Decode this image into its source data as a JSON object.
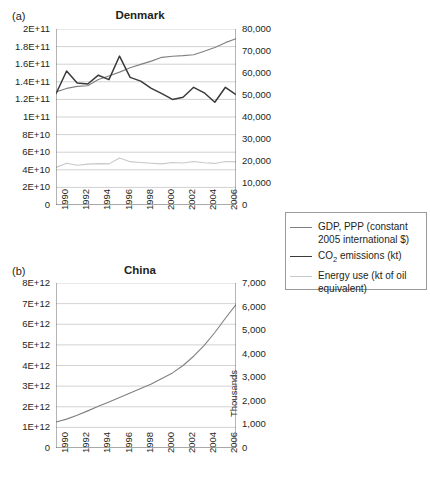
{
  "figure": {
    "panels": [
      {
        "key": "denmark",
        "label": "(a)",
        "title": "Denmark"
      },
      {
        "key": "china",
        "label": "(b)",
        "title": "China"
      }
    ]
  },
  "legend": {
    "items": [
      {
        "name": "gdp",
        "label": "GDP, PPP (constant 2005 international $)",
        "color": "#808080"
      },
      {
        "name": "co2",
        "label": "CO2 emissions (kt)",
        "label_pre": "CO",
        "label_sub": "2",
        "label_post": " emissions (kt)",
        "color": "#3a3a3a"
      },
      {
        "name": "energy",
        "label": "Energy use (kt of oil equivalent)",
        "color": "#c8c8c8"
      }
    ]
  },
  "chart_data": [
    {
      "type": "line",
      "title": "Denmark",
      "panel_label": "(a)",
      "xlabel": "",
      "ylabel": "",
      "x": [
        1990,
        1991,
        1992,
        1993,
        1994,
        1995,
        1996,
        1997,
        1998,
        1999,
        2000,
        2001,
        2002,
        2003,
        2004,
        2005,
        2006,
        2007
      ],
      "xticklabels": [
        "1990",
        "1992",
        "1994",
        "1996",
        "1998",
        "2000",
        "2002",
        "2004",
        "2006"
      ],
      "xtick_years": [
        1990,
        1992,
        1994,
        1996,
        1998,
        2000,
        2002,
        2004,
        2006
      ],
      "xlim": [
        1990,
        2007
      ],
      "grid": true,
      "legend_position": "right-external",
      "axes": {
        "left": {
          "ylim": [
            0,
            200000000000
          ],
          "ticks": [
            0,
            20000000000,
            40000000000,
            60000000000,
            80000000000,
            100000000000,
            120000000000,
            140000000000,
            160000000000,
            180000000000,
            200000000000
          ],
          "ticklabels": [
            "0",
            "2E+10",
            "4E+10",
            "6E+10",
            "8E+10",
            "1E+11",
            "1.2E+11",
            "1.4E+11",
            "1.6E+11",
            "1.8E+11",
            "2E+11"
          ],
          "series": [
            "GDP, PPP (constant 2005 international $)"
          ]
        },
        "right": {
          "ylim": [
            0,
            80000
          ],
          "ticks": [
            0,
            10000,
            20000,
            30000,
            40000,
            50000,
            60000,
            70000,
            80000
          ],
          "ticklabels": [
            "0",
            "10,000",
            "20,000",
            "30,000",
            "40,000",
            "50,000",
            "60,000",
            "70,000",
            "80,000"
          ],
          "series": [
            "CO2 emissions (kt)",
            "Energy use (kt of oil equivalent)"
          ]
        }
      },
      "series": [
        {
          "name": "GDP, PPP (constant 2005 international $)",
          "axis": "left",
          "color": "#808080",
          "units": "constant 2005 international $",
          "values": [
            128500000000.0,
            132500000000.0,
            134800000000.0,
            135500000000.0,
            142500000000.0,
            146700000000.0,
            151000000000.0,
            156000000000.0,
            159800000000.0,
            163500000000.0,
            167800000000.0,
            169000000000.0,
            169700000000.0,
            170700000000.0,
            174800000000.0,
            179000000000.0,
            184500000000.0,
            189000000000.0
          ]
        },
        {
          "name": "CO2 emissions (kt)",
          "axis": "right",
          "color": "#3a3a3a",
          "units": "kt",
          "values": [
            50600,
            60900,
            55500,
            55000,
            59000,
            57000,
            67700,
            58000,
            56300,
            53000,
            50600,
            48000,
            49000,
            53500,
            51000,
            46700,
            53500,
            50200
          ]
        },
        {
          "name": "Energy use (kt of oil equivalent)",
          "axis": "right",
          "color": "#c8c8c8",
          "units": "kt of oil equivalent",
          "values": [
            17100,
            19000,
            18100,
            18600,
            18800,
            18700,
            21400,
            19700,
            19300,
            19000,
            18700,
            19300,
            19100,
            19800,
            19200,
            18900,
            19800,
            19600
          ]
        }
      ]
    },
    {
      "type": "line",
      "title": "China",
      "panel_label": "(b)",
      "xlabel": "",
      "ylabel": "",
      "x": [
        1990,
        1991,
        1992,
        1993,
        1994,
        1995,
        1996,
        1997,
        1998,
        1999,
        2000,
        2001,
        2002,
        2003,
        2004,
        2005,
        2006,
        2007
      ],
      "xticklabels": [
        "1990",
        "1992",
        "1994",
        "1996",
        "1998",
        "2000",
        "2002",
        "2004",
        "2006"
      ],
      "xtick_years": [
        1990,
        1992,
        1994,
        1996,
        1998,
        2000,
        2002,
        2004,
        2006
      ],
      "xlim": [
        1990,
        2007
      ],
      "grid": true,
      "legend_position": "right-external",
      "axes": {
        "left": {
          "ylim": [
            0,
            8000000000000
          ],
          "ticks": [
            0,
            1000000000000,
            2000000000000,
            3000000000000,
            4000000000000,
            5000000000000,
            6000000000000,
            7000000000000,
            8000000000000
          ],
          "ticklabels": [
            "0",
            "1E+12",
            "2E+12",
            "3E+12",
            "4E+12",
            "5E+12",
            "6E+12",
            "7E+12",
            "8E+12"
          ],
          "series": [
            "GDP, PPP (constant 2005 international $)"
          ]
        },
        "right": {
          "ylim": [
            0,
            7000
          ],
          "ticks": [
            0,
            1000,
            2000,
            3000,
            4000,
            5000,
            6000,
            7000
          ],
          "ticklabels": [
            "0",
            "1,000",
            "2,000",
            "3,000",
            "4,000",
            "5,000",
            "6,000",
            "7,000"
          ],
          "title": "Thousands",
          "units_multiplier": 1000,
          "series": [
            "CO2 emissions (kt)",
            "Energy use (kt of oil equivalent)"
          ]
        }
      },
      "series": [
        {
          "name": "GDP, PPP (constant 2005 international $)",
          "axis": "left",
          "color": "#808080",
          "units": "constant 2005 international $",
          "values": [
            1260000000000.0,
            1400000000000.0,
            1590000000000.0,
            1800000000000.0,
            2020000000000.0,
            2230000000000.0,
            2450000000000.0,
            2670000000000.0,
            2880000000000.0,
            3100000000000.0,
            3370000000000.0,
            3640000000000.0,
            4000000000000.0,
            4450000000000.0,
            4980000000000.0,
            5600000000000.0,
            6290000000000.0,
            6950000000000.0
          ]
        },
        {
          "name": "CO2 emissions (kt)",
          "axis": "right",
          "color": "#3a3a3a",
          "units": "kt",
          "values": [
            2480000,
            2620000,
            2740000,
            2900000,
            3080000,
            3250000,
            3450000,
            3460000,
            3370000,
            3320000,
            3370000,
            3490000,
            3690000,
            4350000,
            5070000,
            5590000,
            6100000,
            6530000
          ]
        },
        {
          "name": "Energy use (kt of oil equivalent)",
          "axis": "right",
          "color": "#c8c8c8",
          "units": "kt of oil equivalent",
          "values": [
            870000,
            880000,
            900000,
            940000,
            970000,
            1010000,
            1040000,
            1040000,
            1030000,
            1030000,
            1040000,
            1070000,
            1160000,
            1370000,
            1570000,
            1720000,
            1860000,
            1940000
          ]
        }
      ]
    }
  ]
}
